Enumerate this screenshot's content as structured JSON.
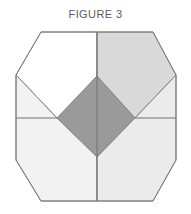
{
  "figure": {
    "caption": "FIGURE 3",
    "caption_color": "#5a5a5a",
    "background_color": "#ffffff",
    "outline_color": "#808080",
    "divider_color": "#707070",
    "shape": {
      "name": "octagon-with-inscribed-diamond",
      "outer": "octagon",
      "inner": "diamond",
      "divisions": 4
    },
    "regions": [
      {
        "name": "top-left-quadrant",
        "label": "Top left quadrant",
        "fill": "#ffffff",
        "points": "16,53 41,10 97,10 97,96 57,96"
      },
      {
        "name": "top-right-quadrant",
        "label": "Top right quadrant",
        "fill": "#d9d9d9",
        "points": "97,10 153,10 176,53 135,96 97,96"
      },
      {
        "name": "bottom-left-quadrant",
        "label": "Bottom left quadrant",
        "fill": "#f2f2f2",
        "points": "16,53 57,96 97,96 97,179 41,179 16,138"
      },
      {
        "name": "bottom-right-quadrant",
        "label": "Bottom right quadrant",
        "fill": "#ebebeb",
        "points": "135,96 176,53 176,138 153,179 97,179 97,96"
      },
      {
        "name": "center-diamond",
        "label": "Center diamond",
        "fill": "#9a9a9a",
        "points": "97,54 135,96 97,135 57,96"
      }
    ],
    "dividers": [
      {
        "name": "vertical-divider",
        "x1": 97,
        "y1": 10,
        "x2": 97,
        "y2": 179
      },
      {
        "name": "horizontal-divider-left",
        "x1": 16,
        "y1": 96,
        "x2": 57,
        "y2": 96
      },
      {
        "name": "horizontal-divider-right",
        "x1": 135,
        "y1": 96,
        "x2": 176,
        "y2": 96
      }
    ],
    "outer_outline": {
      "name": "octagon-outline",
      "points": "41,10 153,10 176,53 176,138 153,179 41,179 16,138 16,53"
    }
  }
}
